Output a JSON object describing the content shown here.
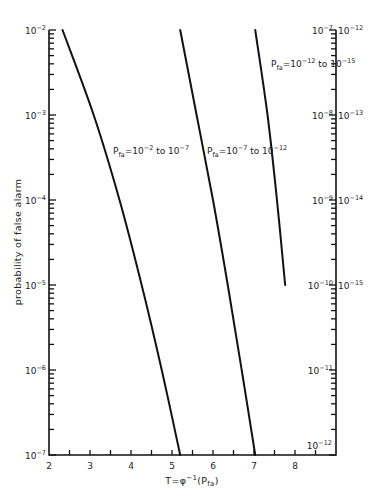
{
  "chart_data": {
    "type": "line",
    "title": "",
    "xlabel": "T = φ⁻¹(P_fa)",
    "xlabel_parts": {
      "main": "T=φ",
      "sup": "-1",
      "tail": "(P",
      "sub": "fa",
      "close": ")"
    },
    "ylabel": "probability of false alarm",
    "xlim": [
      2,
      9
    ],
    "x_ticks_major": [
      2,
      3,
      4,
      5,
      6,
      7,
      8
    ],
    "x_ticks_minor": [
      2.5,
      3.5,
      4.5,
      5.5,
      6.5,
      7.5,
      8.5
    ],
    "y_scale": "log",
    "left_axis": {
      "ylim": [
        1e-07,
        0.01
      ],
      "tick_labels": [
        "10^-2",
        "10^-3",
        "10^-4",
        "10^-5",
        "10^-6",
        "10^-7"
      ],
      "exponents": [
        -2,
        -3,
        -4,
        -5,
        -6,
        -7
      ]
    },
    "right_axis_inner": {
      "ylim": [
        1e-12,
        1e-07
      ],
      "tick_labels": [
        "10^-7",
        "10^-8",
        "10^-9",
        "10^-10",
        "10^-11",
        "10^-12"
      ],
      "exponents": [
        -7,
        -8,
        -9,
        -10,
        -11,
        -12
      ]
    },
    "right_axis_outer": {
      "ylim": [
        1e-15,
        1e-12
      ],
      "tick_labels": [
        "10^-12",
        "10^-13",
        "10^-14",
        "10^-15"
      ],
      "exponents": [
        -12,
        -13,
        -14,
        -15
      ]
    },
    "grid": false,
    "legend": null,
    "series": [
      {
        "name": "P_fa = 10^-2 to 10^-7",
        "axis": "left",
        "label": {
          "pre": "P",
          "sub": "fa",
          "eq": "=10",
          "e1": "-2",
          "mid": " to 10",
          "e2": "-7"
        },
        "points": [
          {
            "T": 2.33,
            "Pfa": 0.01
          },
          {
            "T": 3.09,
            "Pfa": 0.001
          },
          {
            "T": 3.72,
            "Pfa": 0.0001
          },
          {
            "T": 4.26,
            "Pfa": 1e-05
          },
          {
            "T": 4.75,
            "Pfa": 1e-06
          },
          {
            "T": 5.2,
            "Pfa": 1e-07
          }
        ]
      },
      {
        "name": "P_fa = 10^-7 to 10^-12",
        "axis": "right_inner",
        "label": {
          "pre": "P",
          "sub": "fa",
          "eq": "=10",
          "e1": "-7",
          "mid": " to 10",
          "e2": "-12"
        },
        "points": [
          {
            "T": 5.2,
            "Pfa": 1e-07
          },
          {
            "T": 5.6,
            "Pfa": 1e-08
          },
          {
            "T": 6.0,
            "Pfa": 1e-09
          },
          {
            "T": 6.36,
            "Pfa": 1e-10
          },
          {
            "T": 6.7,
            "Pfa": 1e-11
          },
          {
            "T": 7.03,
            "Pfa": 1e-12
          }
        ]
      },
      {
        "name": "P_fa = 10^-12 to 10^-15",
        "axis": "right_outer",
        "label": {
          "pre": "P",
          "sub": "fa",
          "eq": "=10",
          "e1": "-12",
          "mid": " to 10",
          "e2": "-15"
        },
        "points": [
          {
            "T": 7.03,
            "Pfa": 1e-12
          },
          {
            "T": 7.33,
            "Pfa": 1e-13
          },
          {
            "T": 7.56,
            "Pfa": 1e-14
          },
          {
            "T": 7.76,
            "Pfa": 1e-15
          }
        ]
      }
    ]
  }
}
